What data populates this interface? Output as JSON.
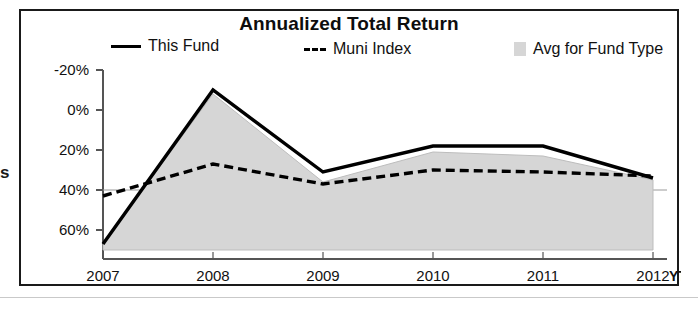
{
  "clipped_text": "s",
  "card": {
    "title": "Annualized Total Return"
  },
  "legend": {
    "this_fund": "This Fund",
    "muni_index": "Muni Index",
    "avg_fund_type": "Avg for Fund Type"
  },
  "axis": {
    "x_end_label": "YTD",
    "y_ticks": [
      "60%",
      "40%",
      "20%",
      "0%",
      "-20%"
    ],
    "x_ticks": [
      "2007",
      "2008",
      "2009",
      "2010",
      "2011",
      "2012"
    ]
  },
  "colors": {
    "this_fund_line": "#000000",
    "muni_index_line": "#000000",
    "avg_fill": "#d6d6d6",
    "border": "#1a1a1a",
    "axis": "#555555",
    "text": "#111111"
  },
  "chart_data": {
    "type": "line",
    "title": "Annualized Total Return",
    "xlabel": "",
    "ylabel": "",
    "categories": [
      "2007",
      "2008",
      "2009",
      "2010",
      "2011",
      "2012"
    ],
    "x_end_annotation": "YTD",
    "ylim": [
      -30,
      60
    ],
    "y_ticks": [
      -20,
      0,
      20,
      40,
      60
    ],
    "grid": false,
    "legend_position": "top",
    "series": [
      {
        "name": "This Fund",
        "style": "solid",
        "values": [
          -27,
          50,
          9,
          22,
          22,
          6
        ]
      },
      {
        "name": "Muni Index",
        "style": "dashed",
        "values": [
          -3,
          13,
          3,
          10,
          9,
          7
        ]
      },
      {
        "name": "Avg for Fund Type",
        "style": "filled-area",
        "values": [
          -27,
          48,
          4,
          19,
          17,
          5
        ]
      }
    ]
  }
}
